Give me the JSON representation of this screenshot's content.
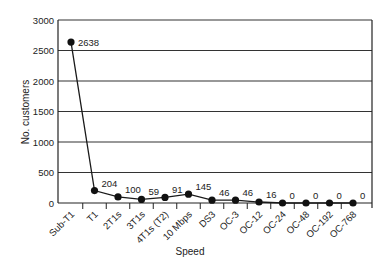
{
  "chart_data": {
    "type": "line",
    "title": "",
    "xlabel": "Speed",
    "ylabel": "No. customers",
    "categories": [
      "Sub-T1",
      "T1",
      "2T1s",
      "3T1s",
      "4T1s (T2)",
      "10 Mbps",
      "DS3",
      "OC-3",
      "OC-12",
      "OC-24",
      "OC-48",
      "OC-192",
      "OC-768"
    ],
    "values": [
      2638,
      204,
      100,
      59,
      91,
      145,
      46,
      46,
      16,
      0,
      0,
      0,
      0
    ],
    "data_labels": [
      "2638",
      "204",
      "100",
      "59",
      "91",
      "145",
      "46",
      "46",
      "16",
      "0",
      "0",
      "0",
      "0"
    ],
    "ylim": [
      0,
      3000
    ],
    "yticks": [
      0,
      500,
      1000,
      1500,
      2000,
      2500,
      3000
    ],
    "grid": "horizontal",
    "legend": "none",
    "colors": {
      "line": "#1a1a1a",
      "marker": "#111111",
      "grid": "#333333",
      "axis": "#222222"
    }
  }
}
